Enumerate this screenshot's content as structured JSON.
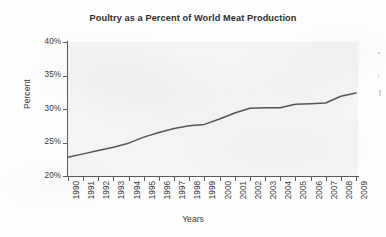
{
  "chart_data": {
    "type": "line",
    "title": "Poultry as a Percent of World Meat Production",
    "xlabel": "Years",
    "ylabel": "Percent",
    "x": [
      1990,
      1991,
      1992,
      1993,
      1994,
      1995,
      1996,
      1997,
      1998,
      1999,
      2000,
      2001,
      2002,
      2003,
      2004,
      2005,
      2006,
      2007,
      2008,
      2009
    ],
    "categories": [
      "1990",
      "1991",
      "1992",
      "1993",
      "1994",
      "1995",
      "1996",
      "1997",
      "1998",
      "1999",
      "2000",
      "2001",
      "2002",
      "2003",
      "2004",
      "2005",
      "2006",
      "2007",
      "2008",
      "2009"
    ],
    "values": [
      22.8,
      23.3,
      23.8,
      24.3,
      24.9,
      25.8,
      26.5,
      27.1,
      27.5,
      27.7,
      28.5,
      29.4,
      30.1,
      30.2,
      30.2,
      30.7,
      30.8,
      30.9,
      31.9,
      32.4
    ],
    "series": [
      {
        "name": "Poultry share of world meat production",
        "values": [
          22.8,
          23.3,
          23.8,
          24.3,
          24.9,
          25.8,
          26.5,
          27.1,
          27.5,
          27.7,
          28.5,
          29.4,
          30.1,
          30.2,
          30.2,
          30.7,
          30.8,
          30.9,
          31.9,
          32.4
        ]
      }
    ],
    "ylim": [
      20,
      40
    ],
    "ytick_values": [
      20,
      25,
      30,
      35,
      40
    ],
    "ytick_labels": [
      "20%",
      "25%",
      "30%",
      "35%",
      "40%"
    ],
    "grid": false,
    "legend": false,
    "legend_position": "none",
    "line_color": "#555555",
    "plot_background": "#f4f4f4",
    "xtick_rotation": "90"
  },
  "axes": {
    "y_label": "Percent",
    "x_label": "Years",
    "y_ticks": [
      "20%",
      "25%",
      "30%",
      "35%",
      "40%"
    ],
    "x_ticks": [
      "1990",
      "1991",
      "1992",
      "1993",
      "1994",
      "1995",
      "1996",
      "1997",
      "1998",
      "1999",
      "2000",
      "2001",
      "2002",
      "2003",
      "2004",
      "2005",
      "2006",
      "2007",
      "2008",
      "2009"
    ]
  },
  "header": {
    "title": "Poultry as a Percent of World Meat Production"
  }
}
